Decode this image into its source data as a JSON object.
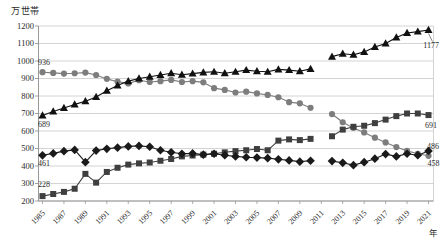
{
  "chart_data": {
    "type": "line",
    "title": "",
    "unit_y": "万世帯",
    "unit_x": "年",
    "ylim": [
      200,
      1200
    ],
    "ytick_step": 100,
    "y_ticks": [
      200,
      300,
      400,
      500,
      600,
      700,
      800,
      900,
      1000,
      1100,
      1200
    ],
    "x": [
      1985,
      1986,
      1987,
      1988,
      1989,
      1990,
      1991,
      1992,
      1993,
      1994,
      1995,
      1996,
      1997,
      1998,
      1999,
      2000,
      2001,
      2002,
      2003,
      2004,
      2005,
      2006,
      2007,
      2008,
      2009,
      2010,
      2011,
      2012,
      2013,
      2014,
      2015,
      2016,
      2017,
      2018,
      2019,
      2020,
      2021
    ],
    "x_tick_labels": [
      "1985",
      "1987",
      "1989",
      "1991",
      "1993",
      "1995",
      "1997",
      "1999",
      "2001",
      "2003",
      "2005",
      "2007",
      "2009",
      "2011",
      "2013",
      "2015",
      "2017",
      "2019",
      "2021"
    ],
    "grid": "horizontal",
    "legend_position": "none",
    "missing_year": 2011,
    "colors": {
      "gridline": "#c9c9c9",
      "axis": "#8c8c8c",
      "text": "#2b2b2b"
    },
    "series": [
      {
        "name": "circle-series",
        "marker": "circle",
        "color": "#7d7d7d",
        "start_label": "936",
        "end_label": "458",
        "values": [
          936,
          932,
          928,
          930,
          934,
          920,
          898,
          882,
          872,
          890,
          880,
          885,
          892,
          880,
          885,
          878,
          845,
          835,
          820,
          825,
          815,
          806,
          793,
          765,
          758,
          733,
          null,
          697,
          650,
          618,
          592,
          562,
          535,
          508,
          486,
          470,
          458
        ]
      },
      {
        "name": "square-series",
        "marker": "square",
        "color": "#3f3f3f",
        "start_label": "228",
        "end_label": "691",
        "values": [
          228,
          240,
          252,
          270,
          355,
          305,
          366,
          390,
          408,
          415,
          420,
          430,
          440,
          455,
          460,
          465,
          470,
          478,
          485,
          490,
          497,
          490,
          545,
          552,
          548,
          555,
          null,
          570,
          608,
          624,
          630,
          645,
          665,
          685,
          700,
          700,
          691
        ]
      },
      {
        "name": "diamond-series",
        "marker": "diamond",
        "color": "#1a1a1a",
        "start_label": "461",
        "end_label": "486",
        "values": [
          461,
          472,
          485,
          492,
          422,
          488,
          498,
          505,
          512,
          515,
          510,
          490,
          478,
          470,
          472,
          465,
          470,
          462,
          455,
          450,
          448,
          445,
          438,
          432,
          425,
          430,
          null,
          428,
          418,
          405,
          422,
          442,
          468,
          455,
          470,
          462,
          486
        ]
      },
      {
        "name": "triangle-series",
        "marker": "triangle",
        "color": "#111111",
        "start_label": "689",
        "end_label": "1177",
        "values": [
          689,
          712,
          732,
          752,
          770,
          795,
          830,
          860,
          885,
          900,
          910,
          920,
          930,
          922,
          928,
          935,
          938,
          930,
          938,
          948,
          942,
          938,
          952,
          948,
          942,
          955,
          null,
          1025,
          1042,
          1036,
          1052,
          1080,
          1100,
          1135,
          1160,
          1168,
          1177
        ]
      }
    ]
  }
}
